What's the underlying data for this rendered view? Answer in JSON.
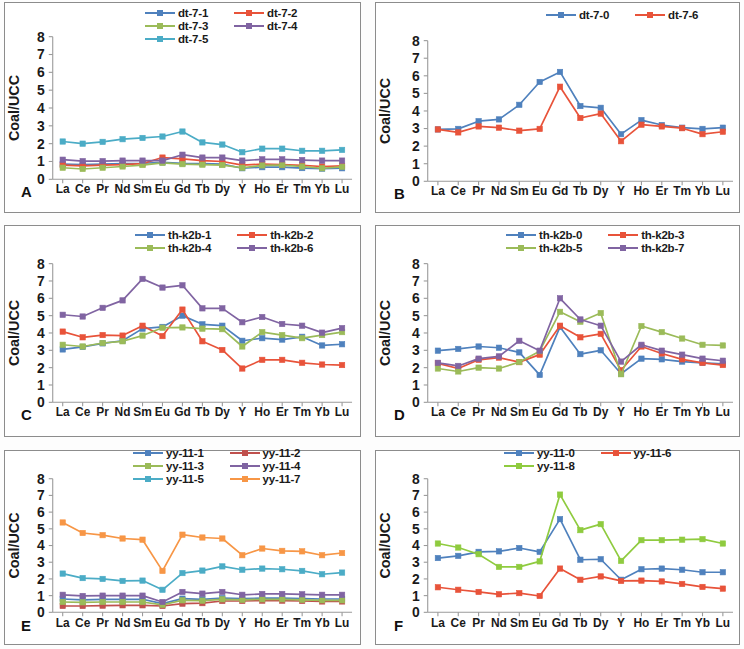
{
  "figure": {
    "ylabel": "Coal/UCC",
    "elements": [
      "La",
      "Ce",
      "Pr",
      "Nd",
      "Sm",
      "Eu",
      "Gd",
      "Tb",
      "Dy",
      "Y",
      "Ho",
      "Er",
      "Tm",
      "Yb",
      "Lu"
    ],
    "yticks": [
      0,
      1,
      2,
      3,
      4,
      5,
      6,
      7,
      8
    ],
    "ylim": [
      0,
      8
    ],
    "colors": {
      "blue": "#4f81bd",
      "red": "#e8533a",
      "green": "#9bbb59",
      "purple": "#8064a2",
      "cyan": "#4bacc6",
      "orange": "#f79646",
      "lightgreen": "#8fcb3f",
      "axis": "#9a9a9a",
      "text": "#1a1a1a"
    }
  },
  "panels": [
    {
      "letter": "A",
      "legend_cols": 2,
      "chart_data": {
        "type": "line",
        "title": "A",
        "xlabel": "",
        "ylabel": "Coal/UCC",
        "ylim": [
          0,
          8
        ],
        "grid": false,
        "legend_position": "top",
        "categories": [
          "La",
          "Ce",
          "Pr",
          "Nd",
          "Sm",
          "Eu",
          "Gd",
          "Tb",
          "Dy",
          "Y",
          "Ho",
          "Er",
          "Tm",
          "Yb",
          "Lu"
        ],
        "series": [
          {
            "name": "dt-7-1",
            "color": "#4f81bd",
            "values": [
              0.85,
              0.82,
              0.85,
              0.88,
              0.9,
              0.95,
              0.9,
              0.88,
              0.85,
              0.62,
              0.68,
              0.68,
              0.63,
              0.6,
              0.62
            ]
          },
          {
            "name": "dt-7-2",
            "color": "#e8533a",
            "values": [
              0.8,
              0.75,
              0.8,
              0.82,
              0.88,
              1.22,
              1.15,
              1.05,
              1.0,
              0.8,
              0.85,
              0.82,
              0.78,
              0.72,
              0.75
            ]
          },
          {
            "name": "dt-7-3",
            "color": "#9bbb59",
            "values": [
              0.65,
              0.58,
              0.65,
              0.72,
              0.8,
              0.92,
              0.85,
              0.82,
              0.8,
              0.65,
              0.78,
              0.8,
              0.72,
              0.62,
              0.7
            ]
          },
          {
            "name": "dt-7-4",
            "color": "#8064a2",
            "values": [
              1.1,
              1.02,
              1.02,
              1.05,
              1.05,
              1.05,
              1.38,
              1.22,
              1.22,
              1.05,
              1.12,
              1.12,
              1.08,
              1.05,
              1.05
            ]
          },
          {
            "name": "dt-7-5",
            "color": "#4bacc6",
            "values": [
              2.12,
              2.0,
              2.1,
              2.25,
              2.32,
              2.4,
              2.68,
              2.07,
              1.95,
              1.52,
              1.72,
              1.72,
              1.6,
              1.6,
              1.65
            ]
          }
        ]
      }
    },
    {
      "letter": "B",
      "legend_cols": 2,
      "chart_data": {
        "type": "line",
        "title": "B",
        "xlabel": "",
        "ylabel": "Coal/UCC",
        "ylim": [
          0,
          8
        ],
        "grid": false,
        "legend_position": "top",
        "categories": [
          "La",
          "Ce",
          "Pr",
          "Nd",
          "Sm",
          "Eu",
          "Gd",
          "Tb",
          "Dy",
          "Y",
          "Ho",
          "Er",
          "Tm",
          "Yb",
          "Lu"
        ],
        "series": [
          {
            "name": "dt-7-0",
            "color": "#4f81bd",
            "values": [
              2.95,
              2.98,
              3.42,
              3.52,
              4.35,
              5.65,
              6.22,
              4.28,
              4.18,
              2.68,
              3.48,
              3.2,
              3.05,
              2.98,
              3.05
            ]
          },
          {
            "name": "dt-7-6",
            "color": "#e8533a",
            "values": [
              2.95,
              2.78,
              3.12,
              3.05,
              2.88,
              2.98,
              5.38,
              3.6,
              3.85,
              2.28,
              3.22,
              3.12,
              3.02,
              2.68,
              2.82
            ]
          }
        ]
      }
    },
    {
      "letter": "C",
      "legend_cols": 2,
      "chart_data": {
        "type": "line",
        "title": "C",
        "xlabel": "",
        "ylabel": "Coal/UCC",
        "ylim": [
          0,
          8
        ],
        "grid": false,
        "legend_position": "top",
        "categories": [
          "La",
          "Ce",
          "Pr",
          "Nd",
          "Sm",
          "Eu",
          "Gd",
          "Tb",
          "Dy",
          "Y",
          "Ho",
          "Er",
          "Tm",
          "Yb",
          "Lu"
        ],
        "series": [
          {
            "name": "th-k2b-1",
            "color": "#4f81bd",
            "values": [
              3.05,
              3.2,
              3.4,
              3.55,
              4.25,
              4.35,
              5.0,
              4.5,
              4.42,
              3.55,
              3.7,
              3.62,
              3.78,
              3.28,
              3.35
            ]
          },
          {
            "name": "th-k2b-2",
            "color": "#e8533a",
            "values": [
              4.08,
              3.75,
              3.88,
              3.85,
              4.42,
              3.82,
              5.35,
              3.52,
              3.02,
              1.95,
              2.45,
              2.45,
              2.28,
              2.18,
              2.15
            ]
          },
          {
            "name": "th-k2b-4",
            "color": "#9bbb59",
            "values": [
              3.32,
              3.22,
              3.42,
              3.52,
              3.85,
              4.3,
              4.32,
              4.25,
              4.22,
              3.22,
              4.05,
              3.88,
              3.7,
              3.88,
              4.05
            ]
          },
          {
            "name": "th-k2b-6",
            "color": "#8064a2",
            "values": [
              5.05,
              4.95,
              5.45,
              5.88,
              7.12,
              6.62,
              6.75,
              5.42,
              5.42,
              4.62,
              4.92,
              4.52,
              4.42,
              4.02,
              4.28
            ]
          }
        ]
      }
    },
    {
      "letter": "D",
      "legend_cols": 2,
      "chart_data": {
        "type": "line",
        "title": "D",
        "xlabel": "",
        "ylabel": "Coal/UCC",
        "ylim": [
          0,
          8
        ],
        "grid": false,
        "legend_position": "top",
        "categories": [
          "La",
          "Ce",
          "Pr",
          "Nd",
          "Sm",
          "Eu",
          "Gd",
          "Tb",
          "Dy",
          "Y",
          "Ho",
          "Er",
          "Tm",
          "Yb",
          "Lu"
        ],
        "series": [
          {
            "name": "th-k2b-0",
            "color": "#4f81bd",
            "values": [
              2.98,
              3.08,
              3.22,
              3.15,
              2.88,
              1.58,
              4.35,
              2.78,
              3.0,
              1.65,
              2.52,
              2.48,
              2.35,
              2.28,
              2.22
            ]
          },
          {
            "name": "th-k2b-3",
            "color": "#e8533a",
            "values": [
              2.25,
              1.95,
              2.45,
              2.58,
              2.32,
              2.75,
              4.42,
              3.75,
              3.95,
              1.85,
              3.22,
              2.82,
              2.48,
              2.28,
              2.15
            ]
          },
          {
            "name": "th-k2b-5",
            "color": "#9bbb59",
            "values": [
              1.95,
              1.78,
              2.0,
              1.95,
              2.32,
              2.95,
              5.22,
              4.65,
              5.15,
              1.62,
              4.4,
              4.05,
              3.68,
              3.32,
              3.28
            ]
          },
          {
            "name": "th-k2b-7",
            "color": "#8064a2",
            "values": [
              2.28,
              2.1,
              2.52,
              2.65,
              3.55,
              2.98,
              6.0,
              4.78,
              4.42,
              2.35,
              3.32,
              2.98,
              2.75,
              2.52,
              2.4
            ]
          }
        ]
      }
    },
    {
      "letter": "E",
      "legend_cols": 2,
      "chart_data": {
        "type": "line",
        "title": "E",
        "xlabel": "",
        "ylabel": "Coal/UCC",
        "ylim": [
          0,
          8
        ],
        "grid": false,
        "legend_position": "top",
        "categories": [
          "La",
          "Ce",
          "Pr",
          "Nd",
          "Sm",
          "Eu",
          "Gd",
          "Tb",
          "Dy",
          "Y",
          "Ho",
          "Er",
          "Tm",
          "Yb",
          "Lu"
        ],
        "series": [
          {
            "name": "yy-11-1",
            "color": "#4f81bd",
            "values": [
              0.8,
              0.75,
              0.78,
              0.78,
              0.78,
              0.52,
              0.82,
              0.78,
              0.85,
              0.82,
              0.85,
              0.85,
              0.82,
              0.8,
              0.8
            ]
          },
          {
            "name": "yy-11-2",
            "color": "#c0504d",
            "values": [
              0.38,
              0.38,
              0.4,
              0.42,
              0.42,
              0.38,
              0.52,
              0.55,
              0.68,
              0.68,
              0.7,
              0.7,
              0.68,
              0.65,
              0.65
            ]
          },
          {
            "name": "yy-11-3",
            "color": "#9bbb59",
            "values": [
              0.62,
              0.6,
              0.62,
              0.62,
              0.62,
              0.45,
              0.72,
              0.7,
              0.78,
              0.75,
              0.78,
              0.78,
              0.75,
              0.72,
              0.72
            ]
          },
          {
            "name": "yy-11-4",
            "color": "#8064a2",
            "values": [
              1.05,
              0.98,
              1.0,
              1.0,
              1.0,
              0.62,
              1.22,
              1.12,
              1.22,
              1.05,
              1.1,
              1.1,
              1.08,
              1.05,
              1.05
            ]
          },
          {
            "name": "yy-11-5",
            "color": "#4bacc6",
            "values": [
              2.32,
              2.05,
              2.0,
              1.88,
              1.9,
              1.35,
              2.35,
              2.5,
              2.75,
              2.55,
              2.62,
              2.58,
              2.48,
              2.28,
              2.38
            ]
          },
          {
            "name": "yy-11-7",
            "color": "#f79646",
            "values": [
              5.38,
              4.75,
              4.62,
              4.42,
              4.35,
              2.48,
              4.65,
              4.48,
              4.42,
              3.42,
              3.82,
              3.68,
              3.65,
              3.42,
              3.55
            ]
          }
        ]
      }
    },
    {
      "letter": "F",
      "legend_cols": 2,
      "chart_data": {
        "type": "line",
        "title": "F",
        "xlabel": "",
        "ylabel": "Coal/UCC",
        "ylim": [
          0,
          8
        ],
        "grid": false,
        "legend_position": "top",
        "categories": [
          "La",
          "Ce",
          "Pr",
          "Nd",
          "Sm",
          "Eu",
          "Gd",
          "Tb",
          "Dy",
          "Y",
          "Ho",
          "Er",
          "Tm",
          "Yb",
          "Lu"
        ],
        "series": [
          {
            "name": "yy-11-0",
            "color": "#4f81bd",
            "values": [
              3.25,
              3.38,
              3.62,
              3.65,
              3.85,
              3.62,
              5.58,
              3.15,
              3.18,
              1.95,
              2.58,
              2.62,
              2.55,
              2.4,
              2.4
            ]
          },
          {
            "name": "yy-11-6",
            "color": "#e8533a",
            "values": [
              1.5,
              1.35,
              1.22,
              1.08,
              1.15,
              0.98,
              2.62,
              1.95,
              2.15,
              1.88,
              1.9,
              1.85,
              1.7,
              1.52,
              1.42
            ]
          },
          {
            "name": "yy-11-8",
            "color": "#8fcb3f",
            "values": [
              4.12,
              3.88,
              3.48,
              2.72,
              2.72,
              3.05,
              7.05,
              4.92,
              5.28,
              3.08,
              4.32,
              4.32,
              4.35,
              4.38,
              4.12
            ]
          }
        ]
      }
    }
  ]
}
